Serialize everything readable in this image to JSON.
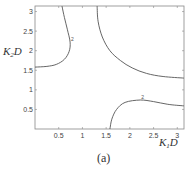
{
  "chart_data": {
    "type": "line",
    "subtype": "contour",
    "title": "",
    "caption": "(a)",
    "xlabel": "K1D",
    "ylabel": "K2D",
    "xlabel_parts": {
      "main": "K",
      "sub": "1",
      "tail": "D"
    },
    "ylabel_parts": {
      "main": "K",
      "sub": "2",
      "tail": "D"
    },
    "xlim": [
      0,
      3.14159
    ],
    "ylim": [
      0,
      3.14159
    ],
    "xticks": [
      0.5,
      1,
      1.5,
      2,
      2.5,
      3
    ],
    "yticks": [
      0.5,
      1,
      1.5,
      2,
      2.5,
      3
    ],
    "xtick_labels": [
      "0.5",
      "1",
      "1.5",
      "2",
      "2.5",
      "3"
    ],
    "ytick_labels": [
      "0.5",
      "1",
      "1.5",
      "2",
      "2.5",
      "3"
    ],
    "grid": false,
    "legend": null,
    "series": [
      {
        "name": "contour-upper-left",
        "level_label": "2",
        "x": [
          0.57,
          0.62,
          0.68,
          0.74,
          0.72,
          0.62,
          0.45,
          0.25,
          0.0
        ],
        "y": [
          3.14,
          2.85,
          2.55,
          2.22,
          1.98,
          1.78,
          1.65,
          1.6,
          1.58
        ]
      },
      {
        "name": "contour-upper-right",
        "level_label": "",
        "x": [
          1.31,
          1.33,
          1.42,
          1.58,
          1.8,
          2.05,
          2.35,
          2.7,
          3.14
        ],
        "y": [
          3.14,
          2.75,
          2.35,
          2.0,
          1.75,
          1.56,
          1.42,
          1.34,
          1.3
        ]
      },
      {
        "name": "contour-lower-right",
        "level_label": "2",
        "x": [
          1.58,
          1.62,
          1.72,
          1.9,
          2.22,
          2.5,
          2.8,
          3.14
        ],
        "y": [
          0.0,
          0.25,
          0.5,
          0.68,
          0.74,
          0.7,
          0.63,
          0.59
        ]
      }
    ],
    "colors": {
      "line": "#555555",
      "axis": "#888888",
      "text": "#444444"
    }
  }
}
